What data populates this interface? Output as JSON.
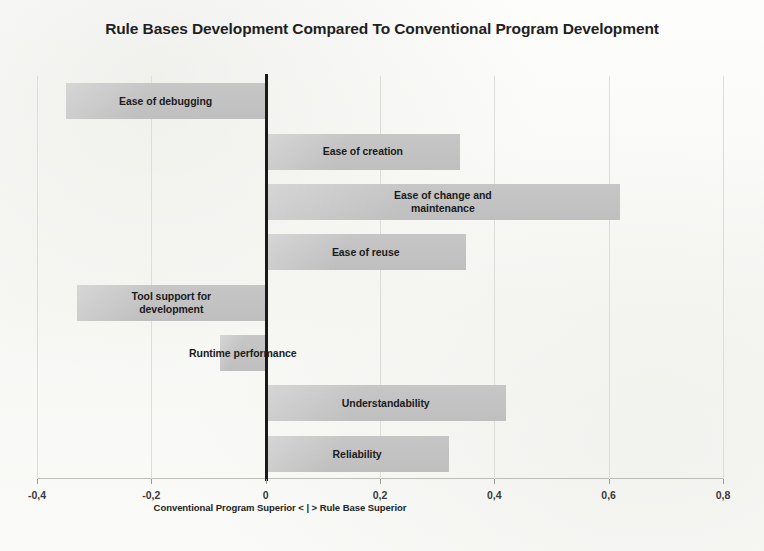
{
  "chart_data": {
    "type": "bar",
    "orientation": "horizontal",
    "title": "Rule Bases Development Compared To Conventional Program Development",
    "xlabel": "Conventional Program Superior < | > Rule Base Superior",
    "ylabel": "",
    "xlim": [
      -0.4,
      0.8
    ],
    "xticks": [
      -0.4,
      -0.2,
      0,
      0.2,
      0.4,
      0.6,
      0.8
    ],
    "xticklabels": [
      "-0,4",
      "-0,2",
      "0",
      "0,2",
      "0,4",
      "0,6",
      "0,8"
    ],
    "grid": true,
    "legend": false,
    "zero_line": true,
    "bar_color": "#c6c6c6",
    "categories": [
      "Ease of debugging",
      "Ease of creation",
      "Ease of change and\nmaintenance",
      "Ease of reuse",
      "Tool support for\ndevelopment",
      "Runtime performance",
      "Understandability",
      "Reliability"
    ],
    "values": [
      -0.35,
      0.34,
      0.62,
      0.35,
      -0.33,
      -0.08,
      0.42,
      0.32
    ],
    "bars": [
      {
        "label": "Ease of debugging",
        "value": -0.35,
        "label_inside": true
      },
      {
        "label": "Ease of creation",
        "value": 0.34,
        "label_inside": true
      },
      {
        "label": "Ease of change and\nmaintenance",
        "value": 0.62,
        "label_inside": true
      },
      {
        "label": "Ease of reuse",
        "value": 0.35,
        "label_inside": true
      },
      {
        "label": "Tool support for\ndevelopment",
        "value": -0.33,
        "label_inside": true
      },
      {
        "label": "Runtime performance",
        "value": -0.08,
        "label_inside": false
      },
      {
        "label": "Understandability",
        "value": 0.42,
        "label_inside": true
      },
      {
        "label": "Reliability",
        "value": 0.32,
        "label_inside": true
      }
    ]
  }
}
